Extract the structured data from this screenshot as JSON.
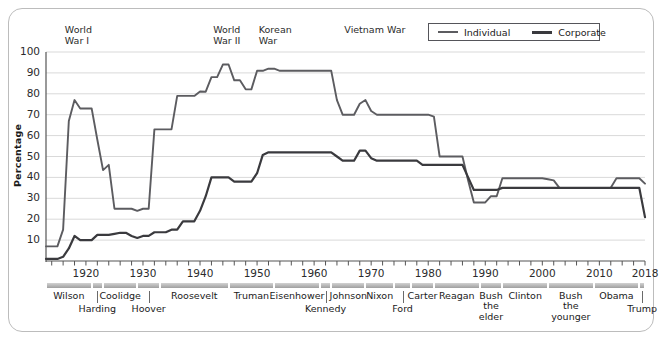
{
  "chart_data": {
    "type": "line",
    "title": "",
    "xlabel": "",
    "ylabel": "Percentage",
    "ylim": [
      0,
      100
    ],
    "xlim": [
      1913,
      2018
    ],
    "yticks": [
      10,
      20,
      30,
      40,
      50,
      60,
      70,
      80,
      90,
      100
    ],
    "xticks": [
      1920,
      1930,
      1940,
      1950,
      1960,
      1970,
      1980,
      1990,
      2000,
      2010,
      2018
    ],
    "grid": true,
    "legend_position": "top-right",
    "series": [
      {
        "name": "Individual",
        "color": "#5c5c60",
        "points": [
          [
            1913,
            7
          ],
          [
            1915,
            7
          ],
          [
            1916,
            15
          ],
          [
            1917,
            67
          ],
          [
            1918,
            77
          ],
          [
            1919,
            73
          ],
          [
            1920,
            73
          ],
          [
            1921,
            73
          ],
          [
            1922,
            58
          ],
          [
            1923,
            43.5
          ],
          [
            1924,
            46
          ],
          [
            1925,
            25
          ],
          [
            1926,
            25
          ],
          [
            1927,
            25
          ],
          [
            1928,
            25
          ],
          [
            1929,
            24
          ],
          [
            1930,
            25
          ],
          [
            1931,
            25
          ],
          [
            1932,
            63
          ],
          [
            1933,
            63
          ],
          [
            1934,
            63
          ],
          [
            1935,
            63
          ],
          [
            1936,
            79
          ],
          [
            1937,
            79
          ],
          [
            1938,
            79
          ],
          [
            1939,
            79
          ],
          [
            1940,
            81.1
          ],
          [
            1941,
            81
          ],
          [
            1942,
            88
          ],
          [
            1943,
            88
          ],
          [
            1944,
            94
          ],
          [
            1945,
            94
          ],
          [
            1946,
            86.45
          ],
          [
            1947,
            86.45
          ],
          [
            1948,
            82.13
          ],
          [
            1949,
            82.13
          ],
          [
            1950,
            91
          ],
          [
            1951,
            91
          ],
          [
            1952,
            92
          ],
          [
            1953,
            92
          ],
          [
            1954,
            91
          ],
          [
            1955,
            91
          ],
          [
            1956,
            91
          ],
          [
            1957,
            91
          ],
          [
            1958,
            91
          ],
          [
            1959,
            91
          ],
          [
            1960,
            91
          ],
          [
            1961,
            91
          ],
          [
            1962,
            91
          ],
          [
            1963,
            91
          ],
          [
            1964,
            77
          ],
          [
            1965,
            70
          ],
          [
            1966,
            70
          ],
          [
            1967,
            70
          ],
          [
            1968,
            75.25
          ],
          [
            1969,
            77
          ],
          [
            1970,
            71.75
          ],
          [
            1971,
            70
          ],
          [
            1972,
            70
          ],
          [
            1973,
            70
          ],
          [
            1974,
            70
          ],
          [
            1975,
            70
          ],
          [
            1976,
            70
          ],
          [
            1977,
            70
          ],
          [
            1978,
            70
          ],
          [
            1979,
            70
          ],
          [
            1980,
            70
          ],
          [
            1981,
            69.125
          ],
          [
            1982,
            50
          ],
          [
            1983,
            50
          ],
          [
            1984,
            50
          ],
          [
            1985,
            50
          ],
          [
            1986,
            50
          ],
          [
            1987,
            38.5
          ],
          [
            1988,
            28
          ],
          [
            1989,
            28
          ],
          [
            1990,
            28
          ],
          [
            1991,
            31
          ],
          [
            1992,
            31
          ],
          [
            1993,
            39.6
          ],
          [
            1994,
            39.6
          ],
          [
            1995,
            39.6
          ],
          [
            1996,
            39.6
          ],
          [
            1997,
            39.6
          ],
          [
            1998,
            39.6
          ],
          [
            1999,
            39.6
          ],
          [
            2000,
            39.6
          ],
          [
            2001,
            39.1
          ],
          [
            2002,
            38.6
          ],
          [
            2003,
            35
          ],
          [
            2004,
            35
          ],
          [
            2005,
            35
          ],
          [
            2006,
            35
          ],
          [
            2007,
            35
          ],
          [
            2008,
            35
          ],
          [
            2009,
            35
          ],
          [
            2010,
            35
          ],
          [
            2011,
            35
          ],
          [
            2012,
            35
          ],
          [
            2013,
            39.6
          ],
          [
            2014,
            39.6
          ],
          [
            2015,
            39.6
          ],
          [
            2016,
            39.6
          ],
          [
            2017,
            39.6
          ],
          [
            2018,
            37
          ]
        ]
      },
      {
        "name": "Corporate",
        "color": "#3a3a3e",
        "points": [
          [
            1913,
            1
          ],
          [
            1914,
            1
          ],
          [
            1915,
            1
          ],
          [
            1916,
            2
          ],
          [
            1917,
            6
          ],
          [
            1918,
            12
          ],
          [
            1919,
            10
          ],
          [
            1920,
            10
          ],
          [
            1921,
            10
          ],
          [
            1922,
            12.5
          ],
          [
            1923,
            12.5
          ],
          [
            1924,
            12.5
          ],
          [
            1925,
            13
          ],
          [
            1926,
            13.5
          ],
          [
            1927,
            13.5
          ],
          [
            1928,
            12
          ],
          [
            1929,
            11
          ],
          [
            1930,
            12
          ],
          [
            1931,
            12
          ],
          [
            1932,
            13.75
          ],
          [
            1933,
            13.75
          ],
          [
            1934,
            13.75
          ],
          [
            1935,
            15
          ],
          [
            1936,
            15
          ],
          [
            1937,
            19
          ],
          [
            1938,
            19
          ],
          [
            1939,
            19
          ],
          [
            1940,
            24
          ],
          [
            1941,
            31
          ],
          [
            1942,
            40
          ],
          [
            1943,
            40
          ],
          [
            1944,
            40
          ],
          [
            1945,
            40
          ],
          [
            1946,
            38
          ],
          [
            1947,
            38
          ],
          [
            1948,
            38
          ],
          [
            1949,
            38
          ],
          [
            1950,
            42
          ],
          [
            1951,
            50.75
          ],
          [
            1952,
            52
          ],
          [
            1953,
            52
          ],
          [
            1954,
            52
          ],
          [
            1955,
            52
          ],
          [
            1956,
            52
          ],
          [
            1957,
            52
          ],
          [
            1958,
            52
          ],
          [
            1959,
            52
          ],
          [
            1960,
            52
          ],
          [
            1961,
            52
          ],
          [
            1962,
            52
          ],
          [
            1963,
            52
          ],
          [
            1964,
            50
          ],
          [
            1965,
            48
          ],
          [
            1966,
            48
          ],
          [
            1967,
            48
          ],
          [
            1968,
            52.8
          ],
          [
            1969,
            52.8
          ],
          [
            1970,
            49.2
          ],
          [
            1971,
            48
          ],
          [
            1972,
            48
          ],
          [
            1973,
            48
          ],
          [
            1974,
            48
          ],
          [
            1975,
            48
          ],
          [
            1976,
            48
          ],
          [
            1977,
            48
          ],
          [
            1978,
            48
          ],
          [
            1979,
            46
          ],
          [
            1980,
            46
          ],
          [
            1981,
            46
          ],
          [
            1982,
            46
          ],
          [
            1983,
            46
          ],
          [
            1984,
            46
          ],
          [
            1985,
            46
          ],
          [
            1986,
            46
          ],
          [
            1987,
            40
          ],
          [
            1988,
            34
          ],
          [
            1989,
            34
          ],
          [
            1990,
            34
          ],
          [
            1991,
            34
          ],
          [
            1992,
            34
          ],
          [
            1993,
            35
          ],
          [
            1994,
            35
          ],
          [
            1995,
            35
          ],
          [
            1996,
            35
          ],
          [
            1997,
            35
          ],
          [
            1998,
            35
          ],
          [
            1999,
            35
          ],
          [
            2000,
            35
          ],
          [
            2001,
            35
          ],
          [
            2002,
            35
          ],
          [
            2003,
            35
          ],
          [
            2004,
            35
          ],
          [
            2005,
            35
          ],
          [
            2006,
            35
          ],
          [
            2007,
            35
          ],
          [
            2008,
            35
          ],
          [
            2009,
            35
          ],
          [
            2010,
            35
          ],
          [
            2011,
            35
          ],
          [
            2012,
            35
          ],
          [
            2013,
            35
          ],
          [
            2014,
            35
          ],
          [
            2015,
            35
          ],
          [
            2016,
            35
          ],
          [
            2017,
            35
          ],
          [
            2018,
            21
          ]
        ]
      }
    ],
    "annotations": [
      {
        "text": "World\nWar I",
        "year": 1917
      },
      {
        "text": "World\nWar II",
        "year": 1943
      },
      {
        "text": "Korean\nWar",
        "year": 1951
      },
      {
        "text": "Vietnam War",
        "year": 1966
      }
    ],
    "presidents": [
      {
        "name": "Wilson",
        "start": 1913,
        "end": 1921,
        "row": 0
      },
      {
        "name": "Harding",
        "start": 1921,
        "end": 1923,
        "row": 1
      },
      {
        "name": "Coolidge",
        "start": 1923,
        "end": 1929,
        "row": 0
      },
      {
        "name": "Hoover",
        "start": 1929,
        "end": 1933,
        "row": 1
      },
      {
        "name": "Roosevelt",
        "start": 1933,
        "end": 1945,
        "row": 0
      },
      {
        "name": "Truman",
        "start": 1945,
        "end": 1953,
        "row": 0
      },
      {
        "name": "Eisenhower",
        "start": 1953,
        "end": 1961,
        "row": 0
      },
      {
        "name": "Kennedy",
        "start": 1961,
        "end": 1963,
        "row": 1
      },
      {
        "name": "Johnson",
        "start": 1963,
        "end": 1969,
        "row": 0
      },
      {
        "name": "Nixon",
        "start": 1969,
        "end": 1974,
        "row": 0
      },
      {
        "name": "Ford",
        "start": 1974,
        "end": 1977,
        "row": 1
      },
      {
        "name": "Carter",
        "start": 1977,
        "end": 1981,
        "row": 0
      },
      {
        "name": "Reagan",
        "start": 1981,
        "end": 1989,
        "row": 0
      },
      {
        "name": "Bush\nthe\nelder",
        "start": 1989,
        "end": 1993,
        "row": 0
      },
      {
        "name": "Clinton",
        "start": 1993,
        "end": 2001,
        "row": 0
      },
      {
        "name": "Bush\nthe\nyounger",
        "start": 2001,
        "end": 2009,
        "row": 0
      },
      {
        "name": "Obama",
        "start": 2009,
        "end": 2017,
        "row": 0
      },
      {
        "name": "Trump",
        "start": 2017,
        "end": 2018,
        "row": 1
      }
    ]
  },
  "legend": {
    "individual_label": "Individual",
    "corporate_label": "Corporate"
  },
  "axis": {
    "y_title": "Percentage"
  }
}
